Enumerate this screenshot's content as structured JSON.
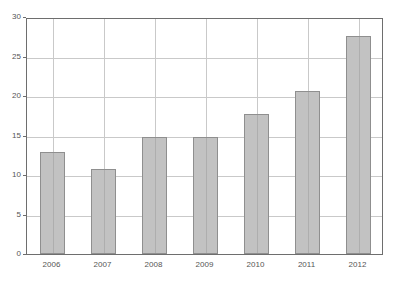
{
  "chart_data": {
    "type": "bar",
    "title": "",
    "subtitle": "",
    "xlabel": "",
    "ylabel": "",
    "categories": [
      "2006",
      "2007",
      "2008",
      "2009",
      "2010",
      "2011",
      "2012"
    ],
    "values": [
      12.9,
      10.8,
      14.8,
      14.75,
      17.7,
      20.6,
      27.6
    ],
    "ylim": [
      0,
      30
    ],
    "yticks": [
      0,
      5,
      10,
      15,
      20,
      25,
      30
    ],
    "ytick_labels": [
      "0",
      "5",
      "10",
      "15",
      "20",
      "25",
      "30"
    ],
    "xtick_labels": [
      "2006",
      "2007",
      "2008",
      "2009",
      "2010",
      "2011",
      "2012"
    ],
    "grid": true,
    "grid_axis": "both",
    "legend": null,
    "legend_position": "none",
    "annotations": [],
    "series": [
      {
        "name": "",
        "values": [
          12.9,
          10.8,
          14.8,
          14.75,
          17.7,
          20.6,
          27.6
        ]
      }
    ]
  },
  "style": {
    "bar_fill": "#c2c2c2",
    "bar_border": "#8f8f8f",
    "grid_color": "#c9c9c9",
    "frame_color": "#6e6e6e",
    "tick_text_color": "#555555",
    "background": "#ffffff"
  }
}
